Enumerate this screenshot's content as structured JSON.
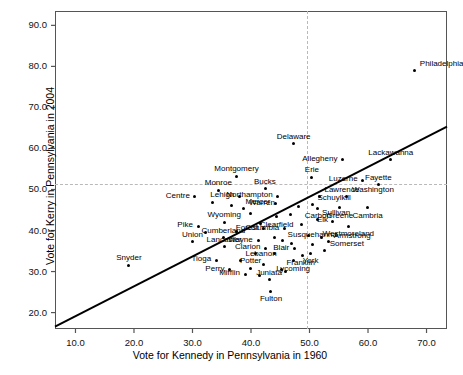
{
  "chart_data": {
    "type": "scatter",
    "title": "",
    "xlabel": "Vote for Kennedy in Pennsylvania in 1960",
    "ylabel": "Vote for Kerry in Pennsylvania in 2004",
    "xlim": [
      6.5,
      73.5
    ],
    "ylim": [
      16.0,
      93.5
    ],
    "xticks": [
      10.0,
      20.0,
      30.0,
      40.0,
      50.0,
      60.0,
      70.0
    ],
    "yticks": [
      20.0,
      30.0,
      40.0,
      50.0,
      60.0,
      70.0,
      80.0,
      90.0
    ],
    "xtick_labels": [
      "10.0",
      "20.0",
      "30.0",
      "40.0",
      "50.0",
      "60.0",
      "70.0"
    ],
    "ytick_labels": [
      "20.0",
      "30.0",
      "40.0",
      "50.0",
      "60.0",
      "70.0",
      "80.0",
      "90.0"
    ],
    "grid": false,
    "reference_lines": [
      {
        "name": "vertical-50-reference",
        "orientation": "vertical",
        "value": 50.0,
        "style": "dashed"
      },
      {
        "name": "horizontal-50-reference",
        "orientation": "horizontal",
        "value": 50.0,
        "style": "dashed"
      }
    ],
    "fit_line": {
      "name": "regression-line",
      "x1": 6.5,
      "y1": 16.6,
      "x2": 73.5,
      "y2": 65.3,
      "style": "solid"
    },
    "points": [
      {
        "label": "Philadelphia",
        "x": 68.0,
        "y": 79.0,
        "lpos": "right"
      },
      {
        "label": "Delaware",
        "x": 47.3,
        "y": 61.2,
        "lpos": "above"
      },
      {
        "label": "Allegheny",
        "x": 55.6,
        "y": 57.3,
        "lpos": "left"
      },
      {
        "label": "Lackawanna",
        "x": 63.9,
        "y": 57.2,
        "lpos": "above"
      },
      {
        "label": "Montgomery",
        "x": 37.5,
        "y": 53.2,
        "lpos": "above"
      },
      {
        "label": "Erie",
        "x": 50.4,
        "y": 53.0,
        "lpos": "above"
      },
      {
        "label": "Luzerne",
        "x": 59.1,
        "y": 52.3,
        "lpos": "left"
      },
      {
        "label": "Fayette",
        "x": 61.8,
        "y": 51.1,
        "lpos": "above"
      },
      {
        "label": "Monroe",
        "x": 34.4,
        "y": 49.8,
        "lpos": "above"
      },
      {
        "label": "Bucks",
        "x": 42.4,
        "y": 50.2,
        "lpos": "above"
      },
      {
        "label": "Centre",
        "x": 30.4,
        "y": 48.2,
        "lpos": "left"
      },
      {
        "label": "Lehigh",
        "x": 38.0,
        "y": 48.3,
        "lpos": "left"
      },
      {
        "label": "Northampton",
        "x": 44.5,
        "y": 48.4,
        "lpos": "left"
      },
      {
        "label": "Lawrence",
        "x": 51.7,
        "y": 48.4,
        "lpos": "right"
      },
      {
        "label": "Washington",
        "x": 56.4,
        "y": 48.3,
        "lpos": "right"
      },
      {
        "label": "Mercer",
        "x": 44.2,
        "y": 46.6,
        "lpos": "left"
      },
      {
        "label": "Schuylkill",
        "x": 50.5,
        "y": 46.4,
        "lpos": "right"
      },
      {
        "label": "Greene",
        "x": 55.2,
        "y": 45.5,
        "lpos": "below"
      },
      {
        "label": "Cambria",
        "x": 59.9,
        "y": 45.5,
        "lpos": "below"
      },
      {
        "label": "Carbon",
        "x": 51.4,
        "y": 45.4,
        "lpos": "below"
      },
      {
        "label": "Warren",
        "x": 38.8,
        "y": 45.3,
        "lpos": "right"
      },
      {
        "label": "Clearfield",
        "x": 44.4,
        "y": 43.4,
        "lpos": "below"
      },
      {
        "label": "Sullivan",
        "x": 51.3,
        "y": 42.8,
        "lpos": "right"
      },
      {
        "label": "Elk",
        "x": 54.0,
        "y": 42.2,
        "lpos": "left"
      },
      {
        "label": "Westmoreland",
        "x": 56.6,
        "y": 41.0,
        "lpos": "below"
      },
      {
        "label": "Wyoming",
        "x": 35.4,
        "y": 42.0,
        "lpos": "above"
      },
      {
        "label": "Pike",
        "x": 31.0,
        "y": 41.0,
        "lpos": "left"
      },
      {
        "label": "Forest",
        "x": 42.2,
        "y": 40.4,
        "lpos": "left"
      },
      {
        "label": "Columbia",
        "x": 45.7,
        "y": 40.4,
        "lpos": "left"
      },
      {
        "label": "Susquehanna",
        "x": 45.4,
        "y": 37.5,
        "lpos": "right"
      },
      {
        "label": "Armstrong",
        "x": 53.3,
        "y": 37.3,
        "lpos": "right"
      },
      {
        "label": "Cumberland",
        "x": 35.3,
        "y": 38.2,
        "lpos": "above"
      },
      {
        "label": "Union",
        "x": 30.0,
        "y": 37.3,
        "lpos": "above"
      },
      {
        "label": "Wayne",
        "x": 41.2,
        "y": 37.5,
        "lpos": "left"
      },
      {
        "label": "Lancaster",
        "x": 35.4,
        "y": 36.0,
        "lpos": "above"
      },
      {
        "label": "Clarion",
        "x": 42.4,
        "y": 35.7,
        "lpos": "left"
      },
      {
        "label": "Blair",
        "x": 47.4,
        "y": 35.6,
        "lpos": "left"
      },
      {
        "label": "Somerset",
        "x": 52.6,
        "y": 35.2,
        "lpos": "right"
      },
      {
        "label": "York",
        "x": 50.2,
        "y": 34.5,
        "lpos": "below"
      },
      {
        "label": "Snyder",
        "x": 19.1,
        "y": 31.5,
        "lpos": "above"
      },
      {
        "label": "Tioga",
        "x": 34.1,
        "y": 32.8,
        "lpos": "left"
      },
      {
        "label": "Lebanon",
        "x": 38.2,
        "y": 32.8,
        "lpos": "right"
      },
      {
        "label": "Lycoming",
        "x": 47.2,
        "y": 32.6,
        "lpos": "below"
      },
      {
        "label": "Perry",
        "x": 36.3,
        "y": 30.4,
        "lpos": "left"
      },
      {
        "label": "Potter",
        "x": 39.9,
        "y": 30.8,
        "lpos": "above"
      },
      {
        "label": "Franklin",
        "x": 45.2,
        "y": 30.6,
        "lpos": "right"
      },
      {
        "label": "Mifflin",
        "x": 39.0,
        "y": 29.3,
        "lpos": "left"
      },
      {
        "label": "Juniata",
        "x": 43.1,
        "y": 28.0,
        "lpos": "above"
      },
      {
        "label": "Fulton",
        "x": 43.4,
        "y": 25.2,
        "lpos": "below"
      }
    ],
    "extra_points": [
      {
        "x": 33.4,
        "y": 46.9
      },
      {
        "x": 36.6,
        "y": 46.2
      },
      {
        "x": 48.1,
        "y": 45.8
      },
      {
        "x": 39.9,
        "y": 44.2
      },
      {
        "x": 46.7,
        "y": 44.0
      },
      {
        "x": 41.6,
        "y": 41.6
      },
      {
        "x": 48.6,
        "y": 41.5
      },
      {
        "x": 37.5,
        "y": 39.8
      },
      {
        "x": 32.2,
        "y": 39.6
      },
      {
        "x": 49.8,
        "y": 38.9
      },
      {
        "x": 44.1,
        "y": 38.4
      },
      {
        "x": 52.1,
        "y": 38.3
      },
      {
        "x": 47.0,
        "y": 36.8
      },
      {
        "x": 50.5,
        "y": 36.6
      },
      {
        "x": 40.7,
        "y": 34.4
      },
      {
        "x": 44.0,
        "y": 34.3
      },
      {
        "x": 48.8,
        "y": 33.8
      },
      {
        "x": 42.1,
        "y": 31.8
      },
      {
        "x": 45.9,
        "y": 30.0
      },
      {
        "x": 41.5,
        "y": 29.0
      }
    ]
  }
}
